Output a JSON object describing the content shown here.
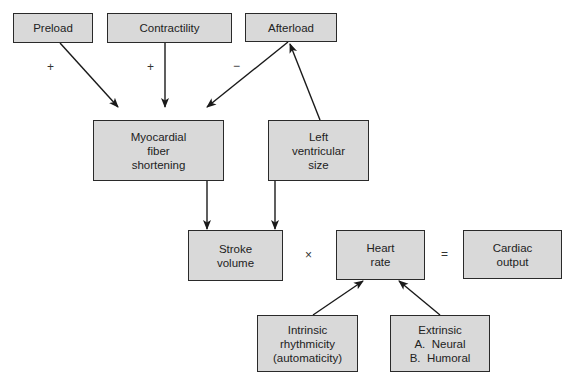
{
  "diagram": {
    "type": "flowchart",
    "nodes": {
      "preload": {
        "label": "Preload"
      },
      "contractility": {
        "label": "Contractility"
      },
      "afterload": {
        "label": "Afterload"
      },
      "myocardial": {
        "lines": [
          "Myocardial",
          "fiber",
          "shortening"
        ]
      },
      "lv_size": {
        "lines": [
          "Left",
          "ventricular",
          "size"
        ]
      },
      "stroke_volume": {
        "lines": [
          "Stroke",
          "volume"
        ]
      },
      "heart_rate": {
        "lines": [
          "Heart",
          "rate"
        ]
      },
      "cardiac_output": {
        "lines": [
          "Cardiac",
          "output"
        ]
      },
      "intrinsic": {
        "lines": [
          "Intrinsic",
          "rhythmicity",
          "(automaticity)"
        ]
      },
      "extrinsic": {
        "lines": [
          "Extrinsic",
          "A.  Neural",
          "B.  Humoral"
        ]
      }
    },
    "edges": [
      {
        "from": "preload",
        "to": "myocardial",
        "sign": "+"
      },
      {
        "from": "contractility",
        "to": "myocardial",
        "sign": "+"
      },
      {
        "from": "afterload",
        "to": "myocardial",
        "sign": "−"
      },
      {
        "from": "lv_size",
        "to": "afterload"
      },
      {
        "from": "myocardial",
        "to": "stroke_volume"
      },
      {
        "from": "lv_size",
        "to": "stroke_volume"
      },
      {
        "from": "intrinsic",
        "to": "heart_rate"
      },
      {
        "from": "extrinsic",
        "to": "heart_rate"
      }
    ],
    "operators": {
      "times": "×",
      "equals": "="
    },
    "signs": {
      "preload": "+",
      "contractility": "+",
      "afterload": "−"
    }
  }
}
